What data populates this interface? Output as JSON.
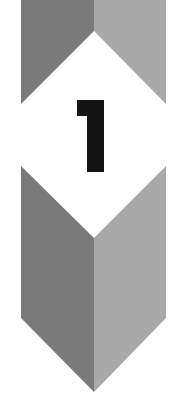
{
  "badge": {
    "number": "1",
    "colors": {
      "background": "#ffffff",
      "left_face": "#7a7a7a",
      "right_face": "#a9a9a9",
      "numeral": "#141414"
    }
  }
}
